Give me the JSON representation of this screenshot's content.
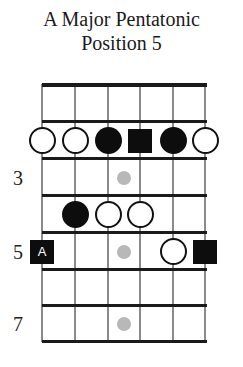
{
  "title": {
    "line1": "A Major Pentatonic",
    "line2": "Position 5"
  },
  "fretboard": {
    "strings": 6,
    "frets_shown": 7,
    "string_x": [
      42,
      75,
      108,
      140,
      173,
      205
    ],
    "fret_y": [
      84,
      121,
      158,
      195,
      232,
      269,
      305,
      341
    ],
    "fret_labels": [
      {
        "row": 3,
        "label": "3"
      },
      {
        "row": 5,
        "label": "5"
      },
      {
        "row": 7,
        "label": "7"
      }
    ],
    "inlays": [
      {
        "row": 3
      },
      {
        "row": 5
      },
      {
        "row": 7
      }
    ],
    "notes": [
      {
        "row": 2,
        "string": 1,
        "type": "open"
      },
      {
        "row": 2,
        "string": 2,
        "type": "open"
      },
      {
        "row": 2,
        "string": 3,
        "type": "filled"
      },
      {
        "row": 2,
        "string": 4,
        "type": "root",
        "label": ""
      },
      {
        "row": 2,
        "string": 5,
        "type": "filled"
      },
      {
        "row": 2,
        "string": 6,
        "type": "open"
      },
      {
        "row": 4,
        "string": 2,
        "type": "filled"
      },
      {
        "row": 4,
        "string": 3,
        "type": "open"
      },
      {
        "row": 4,
        "string": 4,
        "type": "open"
      },
      {
        "row": 5,
        "string": 1,
        "type": "root",
        "label": "A"
      },
      {
        "row": 5,
        "string": 5,
        "type": "open"
      },
      {
        "row": 5,
        "string": 6,
        "type": "root",
        "label": ""
      }
    ],
    "colors": {
      "fret_line": "#1a1a1a",
      "string_line": "#8a8a8a",
      "filled_note": "#0d0d0d",
      "inlay": "#b8b8b8",
      "root_text": "#ffffff"
    }
  }
}
